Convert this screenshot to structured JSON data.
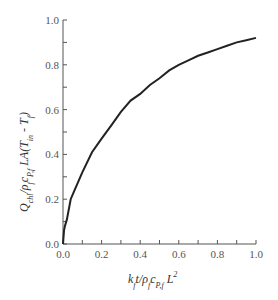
{
  "chart_data": {
    "type": "line",
    "title": "",
    "xlabel": "k_f t / ρ_f c_P,f L^2",
    "ylabel": "Q_chl / ρ_f c_P,f LA(T_in − T_f)",
    "xlim": [
      0.0,
      1.0
    ],
    "ylim": [
      0.0,
      1.0
    ],
    "xticks": [
      "0.0",
      "0.2",
      "0.4",
      "0.6",
      "0.8",
      "1.0"
    ],
    "yticks": [
      "0.0",
      "0.2",
      "0.4",
      "0.6",
      "0.8",
      "1.0"
    ],
    "minor_ticks": true,
    "grid": false,
    "legend": null,
    "series": [
      {
        "name": "Q_chl",
        "color": "#222222",
        "x": [
          0.0,
          0.005,
          0.01,
          0.02,
          0.04,
          0.06,
          0.1,
          0.15,
          0.2,
          0.25,
          0.3,
          0.35,
          0.4,
          0.45,
          0.5,
          0.55,
          0.6,
          0.65,
          0.7,
          0.75,
          0.8,
          0.85,
          0.9,
          0.95,
          1.0
        ],
        "values": [
          0.0,
          0.06,
          0.08,
          0.11,
          0.2,
          0.24,
          0.32,
          0.41,
          0.47,
          0.53,
          0.59,
          0.64,
          0.67,
          0.71,
          0.74,
          0.775,
          0.8,
          0.82,
          0.84,
          0.855,
          0.87,
          0.885,
          0.9,
          0.91,
          0.92
        ]
      }
    ]
  },
  "labels": {
    "y_tick_0": "0.0",
    "y_tick_1": "0.2",
    "y_tick_2": "0.4",
    "y_tick_3": "0.6",
    "y_tick_4": "0.8",
    "y_tick_5": "1.0",
    "x_tick_0": "0.0",
    "x_tick_1": "0.2",
    "x_tick_2": "0.4",
    "x_tick_3": "0.6",
    "x_tick_4": "0.8",
    "x_tick_5": "1.0"
  }
}
